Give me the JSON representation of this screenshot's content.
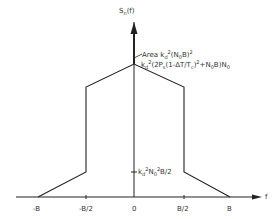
{
  "diagram": {
    "y_axis_label": "S",
    "y_axis_label_sub": "n",
    "y_axis_label_arg": "(f)",
    "x_axis_label": "f",
    "impulse_label": {
      "prefix": "Area ",
      "k": "k",
      "k_sub": "d",
      "sup": "2",
      "rest": "(N",
      "n_sub": "0",
      "tail": "B)",
      "tail_sup": "2"
    },
    "peak_label": {
      "k": "k",
      "k_sub": "d",
      "sup": "2",
      "mid": "(2P",
      "p_sub": "s",
      "mid2": "(1-ΔT/T",
      "t_sub": "c",
      "mid3": ")",
      "mid3_sup": "2",
      "mid4": "+N",
      "n_sub": "0",
      "mid5": "B)N",
      "n2_sub": "0"
    },
    "step_label": {
      "k": "k",
      "k_sub": "d",
      "sup": "2",
      "mid": "N",
      "n_sub": "0",
      "sup2": "2",
      "tail": "B/2"
    },
    "x_ticks": [
      "-B",
      "-B/2",
      "0",
      "B/2",
      "B"
    ],
    "line_color": "#222222"
  }
}
